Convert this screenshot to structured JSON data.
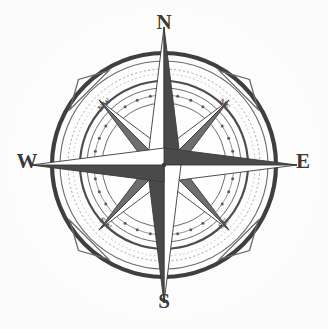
{
  "figure": {
    "kind": "compass-rose",
    "center": {
      "x": 164,
      "y": 165
    },
    "background_color": "#ffffff",
    "ink_color": "#3a3a3a",
    "light_facet_color": "#ffffff",
    "dark_facet_color": "#4a4a4a",
    "mid_facet_color": "#6e6e6e",
    "ring_color": "#595959",
    "faint_ring_color": "#9a9a9a"
  },
  "cardinal_points": [
    {
      "id": "north",
      "label": "N",
      "bearing_deg": 0,
      "label_x": 164,
      "label_y": 24,
      "point_radius": 138,
      "icon": "north-point-icon"
    },
    {
      "id": "east",
      "label": "E",
      "bearing_deg": 90,
      "label_x": 303,
      "label_y": 163,
      "point_radius": 133,
      "icon": "east-point-icon"
    },
    {
      "id": "south",
      "label": "S",
      "bearing_deg": 180,
      "label_x": 164,
      "label_y": 303,
      "point_radius": 138,
      "icon": "south-point-icon"
    },
    {
      "id": "west",
      "label": "W",
      "bearing_deg": 270,
      "label_x": 27,
      "label_y": 163,
      "point_radius": 133,
      "icon": "west-point-icon"
    }
  ],
  "ordinal_points": [
    {
      "id": "northeast",
      "label": "NE",
      "bearing_deg": 45,
      "label_x": 224,
      "label_y": 105,
      "label_rotation": 45,
      "point_radius": 92,
      "icon": "northeast-point-icon"
    },
    {
      "id": "southeast",
      "label": "SE",
      "bearing_deg": 135,
      "label_x": 224,
      "label_y": 224,
      "label_rotation": -45,
      "point_radius": 92,
      "icon": "southeast-point-icon"
    },
    {
      "id": "southwest",
      "label": "SW",
      "bearing_deg": 225,
      "label_x": 105,
      "label_y": 224,
      "label_rotation": 45,
      "point_radius": 92,
      "icon": "southwest-point-icon"
    },
    {
      "id": "northwest",
      "label": "NW",
      "bearing_deg": 315,
      "label_x": 105,
      "label_y": 105,
      "label_rotation": -45,
      "point_radius": 92,
      "icon": "northwest-point-icon"
    }
  ],
  "rings": [
    {
      "id": "outer-heavy-ring",
      "radius": 112,
      "stroke_width": 4.2,
      "color": "#3f3f3f",
      "style": "solid"
    },
    {
      "id": "outer-thin-ring",
      "radius": 104,
      "stroke_width": 1.1,
      "color": "#6b6b6b",
      "style": "solid"
    },
    {
      "id": "hatched-band-ring",
      "radius": 96,
      "stroke_width": 0.9,
      "color": "#9a9a9a",
      "style": "dashed"
    },
    {
      "id": "mid-heavy-ring",
      "radius": 84,
      "stroke_width": 2.2,
      "color": "#4d4d4d",
      "style": "solid"
    },
    {
      "id": "mid-thin-ring",
      "radius": 77,
      "stroke_width": 1.0,
      "color": "#6b6b6b",
      "style": "solid"
    },
    {
      "id": "dotted-marker-ring",
      "radius": 70,
      "stroke_width": 0.9,
      "color": "#8a8a8a",
      "style": "solid"
    },
    {
      "id": "inner-thin-ring",
      "radius": 62,
      "stroke_width": 1.0,
      "color": "#6b6b6b",
      "style": "solid"
    }
  ],
  "dot_markers": {
    "id": "degree-dot-markers",
    "ring_radius": 70,
    "count": 32,
    "dot_radius": 1.5,
    "color": "#5a5a5a"
  },
  "diagonal_arrowheads": {
    "id": "diagonal-arrowhead-markers",
    "count": 4,
    "bearings_deg": [
      45,
      135,
      225,
      315
    ],
    "radius": 116,
    "size": 9,
    "color": "#6a6a6a",
    "fill": "none"
  },
  "star": {
    "major_point_count": 4,
    "minor_point_count": 4,
    "major_point_half_width": 17,
    "minor_point_half_width": 13,
    "minor_point_radius": 92
  }
}
